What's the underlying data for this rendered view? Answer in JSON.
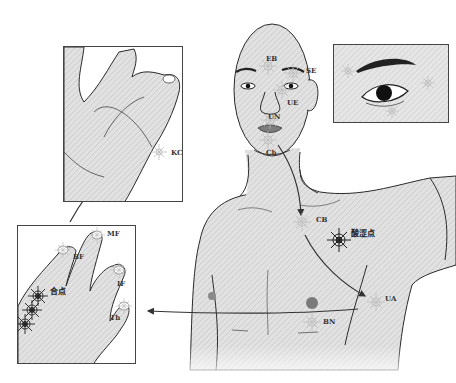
{
  "figure": {
    "type": "acupressure-point diagram",
    "colors": {
      "skin_fill": "#dcdcdc",
      "outline": "#2a2a2a",
      "arrow": "#333333",
      "point_marker_light": "#b8b8b8",
      "point_marker_dark": "#222222",
      "nipple": "#7a7a7a"
    }
  },
  "head": {
    "points": [
      {
        "id": "EB",
        "label": "EB"
      },
      {
        "id": "SE",
        "label": "SE"
      },
      {
        "id": "UE",
        "label": "UE"
      },
      {
        "id": "UN",
        "label": "UN"
      },
      {
        "id": "Ch",
        "label": "Ch"
      }
    ]
  },
  "torso": {
    "points": [
      {
        "id": "CB",
        "label": "CB"
      },
      {
        "id": "sour-point",
        "label": "酸涩点"
      },
      {
        "id": "UA",
        "label": "UA"
      },
      {
        "id": "BN",
        "label": "BN"
      }
    ]
  },
  "palm_panel": {
    "points": [
      {
        "id": "KC",
        "label": "KC"
      }
    ]
  },
  "eye_panel": {
    "description": "close-up of eye with brow points"
  },
  "hand_panel": {
    "points": [
      {
        "id": "BF",
        "label": "BF"
      },
      {
        "id": "MF",
        "label": "MF"
      },
      {
        "id": "IF",
        "label": "IF"
      },
      {
        "id": "Th",
        "label": "Th"
      },
      {
        "id": "he-point",
        "label": "合点"
      }
    ]
  }
}
